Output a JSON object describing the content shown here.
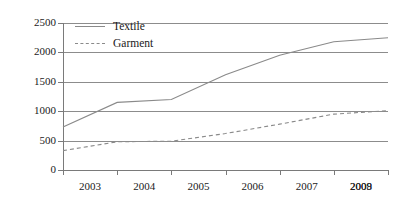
{
  "chart_data": {
    "type": "line",
    "title": "",
    "xlabel": "",
    "ylabel": "",
    "categories": [
      "2003",
      "2004",
      "2005",
      "2006",
      "2007",
      "2008",
      "2009"
    ],
    "x": [
      2003,
      2004,
      2005,
      2006,
      2007,
      2008,
      2009
    ],
    "ylim": [
      0,
      2500
    ],
    "yticks": [
      0,
      500,
      1000,
      1500,
      2000,
      2500
    ],
    "ytick_labels": [
      "0",
      "500",
      "1000",
      "1500",
      "2000",
      "2500"
    ],
    "grid": "horizontal",
    "legend_position": "top-left-inside",
    "series": [
      {
        "name": "Textile",
        "style": "solid",
        "color": "#8a8a8a",
        "values": [
          730,
          1150,
          1200,
          1620,
          1950,
          2180,
          2250
        ]
      },
      {
        "name": "Garment",
        "style": "dashed",
        "color": "#8a8a8a",
        "values": [
          330,
          480,
          490,
          620,
          780,
          950,
          1010
        ]
      }
    ]
  },
  "legend": {
    "items": [
      {
        "label": "Textile",
        "style": "solid"
      },
      {
        "label": "Garment",
        "style": "dashed"
      }
    ]
  },
  "colors": {
    "series_line": "#8a8a8a",
    "gridline": "#8c8c8c",
    "axis": "#7a7a7a",
    "text": "#1a1a1a",
    "background": "#ffffff"
  }
}
